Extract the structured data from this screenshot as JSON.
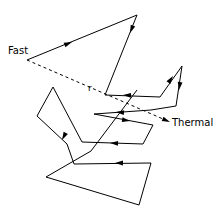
{
  "figure": {
    "type": "diagram",
    "background_color": "#ffffff",
    "stroke_color": "#000000",
    "width": 216,
    "height": 218,
    "labels": [
      {
        "id": "fast",
        "text": "Fast",
        "x": 8,
        "y": 46
      },
      {
        "id": "thermal",
        "text": "Thermal",
        "x": 172,
        "y": 118
      },
      {
        "id": "r",
        "text": "r",
        "x": 88,
        "y": 84
      }
    ],
    "dashed_vector": {
      "name": "displacement-r",
      "label": "r",
      "start": [
        27,
        60
      ],
      "end": [
        170,
        122
      ],
      "style": "dashed",
      "arrow_at_end": true
    },
    "walk_path": {
      "name": "scattering-path",
      "style": "solid",
      "points": [
        [
          27,
          60
        ],
        [
          137,
          15
        ],
        [
          105,
          95
        ],
        [
          160,
          97
        ],
        [
          182,
          66
        ],
        [
          176,
          106
        ],
        [
          151,
          110
        ],
        [
          94,
          114
        ],
        [
          153,
          125
        ],
        [
          143,
          144
        ],
        [
          82,
          142
        ],
        [
          53,
          87
        ],
        [
          37,
          116
        ],
        [
          67,
          144
        ],
        [
          74,
          164
        ],
        [
          151,
          163
        ],
        [
          139,
          205
        ],
        [
          46,
          177
        ],
        [
          91,
          151
        ],
        [
          137,
          90
        ]
      ]
    },
    "arrowheads": [
      {
        "name": "arrow-on-first-leg",
        "x": 72,
        "y": 42,
        "angle": -22
      },
      {
        "name": "arrow-on-second-leg",
        "x": 130,
        "y": 33,
        "angle": 112
      },
      {
        "name": "arrow-on-third-leg",
        "x": 123,
        "y": 95,
        "angle": 182
      },
      {
        "name": "arrow-on-fourth-leg",
        "x": 173,
        "y": 76,
        "angle": -55
      },
      {
        "name": "arrow-on-fifth-leg",
        "x": 179,
        "y": 90,
        "angle": 98
      },
      {
        "name": "arrow-on-sixth-leg",
        "x": 116,
        "y": 112,
        "angle": 184
      },
      {
        "name": "arrow-on-seventh-leg",
        "x": 130,
        "y": 121,
        "angle": 10
      },
      {
        "name": "arrow-on-eighth-leg",
        "x": 110,
        "y": 143,
        "angle": 182
      },
      {
        "name": "arrow-on-ninth-leg",
        "x": 62,
        "y": 140,
        "angle": 118
      },
      {
        "name": "arrow-on-bottom-leg",
        "x": 115,
        "y": 163,
        "angle": 180
      },
      {
        "name": "arrow-on-thermal-vector",
        "x": 170,
        "y": 122,
        "angle": 23
      }
    ]
  }
}
